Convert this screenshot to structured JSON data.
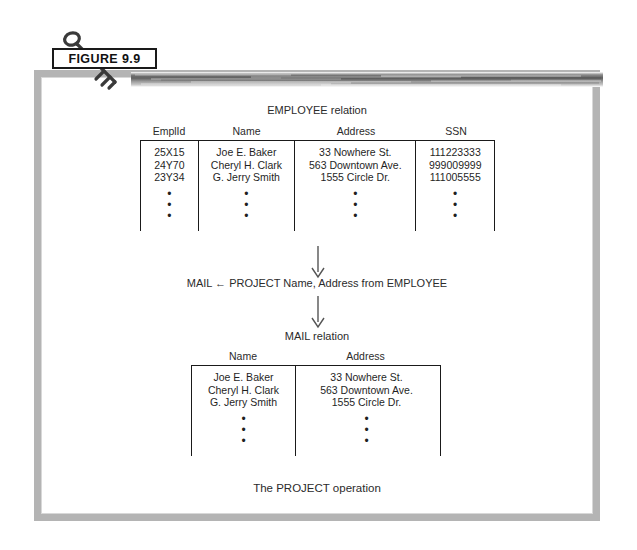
{
  "figure": {
    "label": "FIGURE 9.9",
    "key_icon": "key-icon"
  },
  "employee_relation": {
    "title": "EMPLOYEE relation",
    "columns": [
      "EmplId",
      "Name",
      "Address",
      "SSN"
    ],
    "rows": [
      [
        "25X15",
        "Joe E. Baker",
        "33 Nowhere St.",
        "111223333"
      ],
      [
        "24Y70",
        "Cheryl H. Clark",
        "563 Downtown Ave.",
        "999009999"
      ],
      [
        "23Y34",
        "G. Jerry Smith",
        "1555 Circle Dr.",
        "111005555"
      ]
    ],
    "continuation": "•"
  },
  "operation": {
    "expression": "MAIL ← PROJECT Name, Address from EMPLOYEE",
    "arrow_top": "down-arrow-icon",
    "arrow_bottom": "down-arrow-icon"
  },
  "mail_relation": {
    "title": "MAIL relation",
    "columns": [
      "Name",
      "Address"
    ],
    "rows": [
      [
        "Joe E. Baker",
        "33 Nowhere St."
      ],
      [
        "Cheryl H. Clark",
        "563 Downtown Ave."
      ],
      [
        "G. Jerry Smith",
        "1555 Circle Dr."
      ]
    ],
    "continuation": "•"
  },
  "caption": "The PROJECT operation",
  "colors": {
    "frame": "#b4b4b4",
    "rule": "#1a1a1a",
    "text": "#2b2b2b",
    "page": "#ffffff"
  }
}
